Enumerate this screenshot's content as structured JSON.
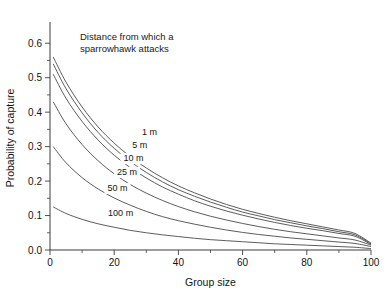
{
  "chart_data": {
    "type": "line",
    "title": "",
    "xlabel": "Group size",
    "ylabel": "Probability of capture",
    "xlim": [
      0,
      100
    ],
    "ylim": [
      0,
      0.65
    ],
    "grid": false,
    "legend_position": "inline-curve-labels",
    "annotation": {
      "line1": "Distance from which a",
      "line2": "sparrowhawk attacks"
    },
    "xticks": [
      {
        "value": 0,
        "label": "0"
      },
      {
        "value": 20,
        "label": "20"
      },
      {
        "value": 40,
        "label": "40"
      },
      {
        "value": 60,
        "label": "60"
      },
      {
        "value": 80,
        "label": "80"
      },
      {
        "value": 100,
        "label": "100"
      }
    ],
    "xticks_minor": [
      10,
      30,
      50,
      70,
      90
    ],
    "yticks": [
      {
        "value": 0.0,
        "label": "0.0"
      },
      {
        "value": 0.1,
        "label": "0.1"
      },
      {
        "value": 0.2,
        "label": "0.2"
      },
      {
        "value": 0.3,
        "label": "0.3"
      },
      {
        "value": 0.4,
        "label": "0.4"
      },
      {
        "value": 0.5,
        "label": "0.5"
      },
      {
        "value": 0.6,
        "label": "0.6"
      }
    ],
    "yticks_minor": [
      0.05,
      0.15,
      0.25,
      0.35,
      0.45,
      0.55
    ],
    "x": [
      1,
      5,
      10,
      15,
      20,
      25,
      30,
      35,
      40,
      45,
      50,
      55,
      60,
      65,
      70,
      75,
      80,
      85,
      90,
      95,
      100
    ],
    "series": [
      {
        "name": "1 m",
        "label": "1 m",
        "label_x": 31,
        "label_y": 0.335,
        "color": "#4a4a4a",
        "values": [
          0.56,
          0.487,
          0.415,
          0.357,
          0.31,
          0.271,
          0.238,
          0.21,
          0.186,
          0.166,
          0.148,
          0.132,
          0.118,
          0.106,
          0.095,
          0.085,
          0.076,
          0.067,
          0.058,
          0.048,
          0.02
        ]
      },
      {
        "name": "5 m",
        "label": "5 m",
        "label_x": 28,
        "label_y": 0.296,
        "color": "#4a4a4a",
        "values": [
          0.54,
          0.468,
          0.398,
          0.341,
          0.295,
          0.257,
          0.225,
          0.198,
          0.175,
          0.156,
          0.139,
          0.124,
          0.11,
          0.099,
          0.088,
          0.079,
          0.07,
          0.062,
          0.053,
          0.044,
          0.018
        ]
      },
      {
        "name": "10 m",
        "label": "10 m",
        "label_x": 26,
        "label_y": 0.258,
        "color": "#4a4a4a",
        "values": [
          0.51,
          0.44,
          0.373,
          0.319,
          0.275,
          0.239,
          0.209,
          0.183,
          0.162,
          0.143,
          0.127,
          0.113,
          0.101,
          0.09,
          0.08,
          0.071,
          0.063,
          0.056,
          0.048,
          0.04,
          0.016
        ]
      },
      {
        "name": "25 m",
        "label": "25 m",
        "label_x": 24,
        "label_y": 0.218,
        "color": "#4a4a4a",
        "values": [
          0.43,
          0.366,
          0.306,
          0.259,
          0.221,
          0.19,
          0.165,
          0.144,
          0.126,
          0.111,
          0.098,
          0.087,
          0.077,
          0.068,
          0.06,
          0.053,
          0.047,
          0.041,
          0.035,
          0.029,
          0.014
        ]
      },
      {
        "name": "50 m",
        "label": "50 m",
        "label_x": 21,
        "label_y": 0.171,
        "color": "#4a4a4a",
        "values": [
          0.3,
          0.253,
          0.21,
          0.177,
          0.151,
          0.13,
          0.112,
          0.097,
          0.085,
          0.075,
          0.066,
          0.058,
          0.051,
          0.045,
          0.04,
          0.035,
          0.031,
          0.027,
          0.023,
          0.019,
          0.01
        ]
      },
      {
        "name": "100 m",
        "label": "100 m",
        "label_x": 22,
        "label_y": 0.098,
        "color": "#4a4a4a",
        "values": [
          0.125,
          0.106,
          0.089,
          0.076,
          0.066,
          0.057,
          0.05,
          0.044,
          0.039,
          0.034,
          0.03,
          0.027,
          0.024,
          0.021,
          0.018,
          0.016,
          0.014,
          0.012,
          0.01,
          0.008,
          0.004
        ]
      }
    ]
  }
}
